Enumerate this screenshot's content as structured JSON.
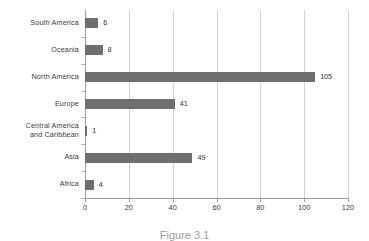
{
  "chart_data": {
    "type": "bar",
    "orientation": "horizontal",
    "title": "",
    "xlabel": "",
    "ylabel": "",
    "categories": [
      "South America",
      "Oceania",
      "North America",
      "Europe",
      "Central America and Caribbean",
      "Asia",
      "Africa"
    ],
    "category_lines": [
      [
        "South America"
      ],
      [
        "Oceania"
      ],
      [
        "North America"
      ],
      [
        "Europe"
      ],
      [
        "Central America",
        "and Caribbean"
      ],
      [
        "Asia"
      ],
      [
        "Africa"
      ]
    ],
    "values": [
      6,
      8,
      105,
      41,
      1,
      49,
      4
    ],
    "value_labels": [
      "6",
      "8",
      "105",
      "41",
      "1",
      "49",
      "4"
    ],
    "xlim": [
      0,
      120
    ],
    "xticks": [
      0,
      20,
      40,
      60,
      80,
      100,
      120
    ],
    "xtick_labels": [
      "0",
      "20",
      "40",
      "60",
      "80",
      "100",
      "120"
    ],
    "grid": "vertical",
    "legend": "none",
    "bar_color": "#6f6f6f",
    "gridline_color": "#d2d2d2",
    "axis_color": "#9a9a9a",
    "background_color": "#ffffff"
  },
  "caption": {
    "text": "Figure 3.1"
  }
}
